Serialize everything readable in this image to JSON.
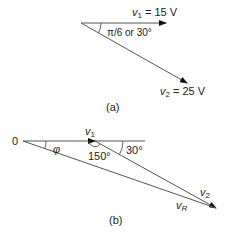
{
  "diagram_a": {
    "v1_symbol": "v",
    "v1_sub": "1",
    "v1_value": " = 15 V",
    "angle_label": "π/6 or 30°",
    "v2_symbol": "v",
    "v2_sub": "2",
    "v2_value": " = 25 V",
    "caption": "(a)"
  },
  "diagram_b": {
    "origin_label": "0",
    "phi_label": "φ",
    "v1_symbol": "v",
    "v1_sub": "1",
    "angle_150": "150°",
    "angle_30": "30°",
    "v2_symbol": "v",
    "v2_sub": "2",
    "vR_symbol": "v",
    "vR_sub": "R",
    "caption": "(b)"
  },
  "colors": {
    "line": "#555555",
    "arrow": "#111111",
    "text": "#222222"
  }
}
